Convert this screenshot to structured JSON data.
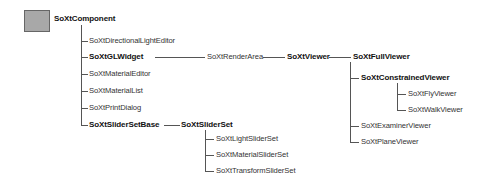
{
  "diagram": {
    "root": {
      "label": "SoXtComponent",
      "bold": true
    },
    "nodes": {
      "directional_light_editor": "SoXtDirectionalLightEditor",
      "gl_widget": "SoXtGLWidget",
      "render_area": "SoXtRenderArea",
      "viewer": "SoXtViewer",
      "full_viewer": "SoXtFullViewer",
      "constrained_viewer": "SoXtConstrainedViewer",
      "fly_viewer": "SoXtFlyViewer",
      "walk_viewer": "SoXtWalkViewer",
      "examiner_viewer": "SoXtExaminerViewer",
      "plane_viewer": "SoXtPlaneViewer",
      "material_editor": "SoXtMaterialEditor",
      "material_list": "SoXtMaterialList",
      "print_dialog": "SoXtPrintDialog",
      "slider_set_base": "SoXtSliderSetBase",
      "slider_set": "SoXtSliderSet",
      "light_slider_set": "SoXtLightSliderSet",
      "material_slider_set": "SoXtMaterialSliderSet",
      "transform_slider_set": "SoXtTransformSliderSet"
    },
    "edges": [
      [
        "SoXtComponent",
        "SoXtDirectionalLightEditor"
      ],
      [
        "SoXtComponent",
        "SoXtGLWidget"
      ],
      [
        "SoXtComponent",
        "SoXtMaterialEditor"
      ],
      [
        "SoXtComponent",
        "SoXtMaterialList"
      ],
      [
        "SoXtComponent",
        "SoXtPrintDialog"
      ],
      [
        "SoXtComponent",
        "SoXtSliderSetBase"
      ],
      [
        "SoXtGLWidget",
        "SoXtRenderArea"
      ],
      [
        "SoXtRenderArea",
        "SoXtViewer"
      ],
      [
        "SoXtViewer",
        "SoXtFullViewer"
      ],
      [
        "SoXtFullViewer",
        "SoXtConstrainedViewer"
      ],
      [
        "SoXtFullViewer",
        "SoXtExaminerViewer"
      ],
      [
        "SoXtFullViewer",
        "SoXtPlaneViewer"
      ],
      [
        "SoXtConstrainedViewer",
        "SoXtFlyViewer"
      ],
      [
        "SoXtConstrainedViewer",
        "SoXtWalkViewer"
      ],
      [
        "SoXtSliderSetBase",
        "SoXtSliderSet"
      ],
      [
        "SoXtSliderSet",
        "SoXtLightSliderSet"
      ],
      [
        "SoXtSliderSet",
        "SoXtMaterialSliderSet"
      ],
      [
        "SoXtSliderSet",
        "SoXtTransformSliderSet"
      ]
    ],
    "bold_nodes": [
      "SoXtComponent",
      "SoXtGLWidget",
      "SoXtViewer",
      "SoXtFullViewer",
      "SoXtConstrainedViewer",
      "SoXtSliderSetBase",
      "SoXtSliderSet"
    ],
    "colors": {
      "root_box": "#a8a8a8",
      "line": "#555555",
      "text": "#333333"
    }
  }
}
